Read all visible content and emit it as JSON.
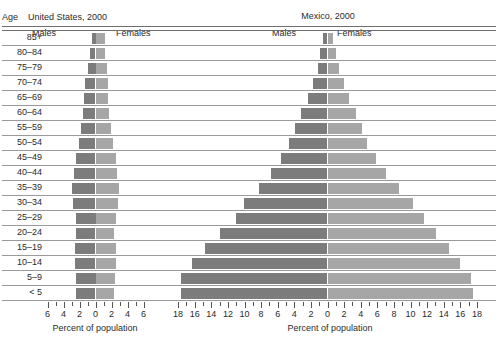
{
  "axis_header": "Age",
  "panels": [
    {
      "key": "united_states",
      "title": "United States, 2000",
      "males_label": "Males",
      "females_label": "Females",
      "xlabel": "Percent of population",
      "tick_labels": [
        "6",
        "4",
        "2",
        "0",
        "2",
        "4",
        "6"
      ]
    },
    {
      "key": "mexico",
      "title": "Mexico, 2000",
      "males_label": "Males",
      "females_label": "Females",
      "xlabel": "Percent of population",
      "tick_labels": [
        "18",
        "16",
        "14",
        "12",
        "10",
        "8",
        "6",
        "4",
        "2",
        "0",
        "2",
        "4",
        "6",
        "8",
        "10",
        "12",
        "14",
        "16",
        "18"
      ]
    }
  ],
  "colors": {
    "male_bar": "#7c7c7c",
    "female_bar": "#a6a6a6",
    "rule": "#9a9a9a",
    "text": "#2b2b2b",
    "background": "#ffffff"
  },
  "chart_data": {
    "type": "bar",
    "subtype": "population-pyramid",
    "xlabel": "Percent of population",
    "ylabel": "Age",
    "grid": true,
    "legend": [
      "Males",
      "Females"
    ],
    "legend_position": "top-inside",
    "categories": [
      "85+",
      "80–84",
      "75–79",
      "70–74",
      "65–69",
      "60–64",
      "55–59",
      "50–54",
      "45–49",
      "40–44",
      "35–39",
      "30–34",
      "25–29",
      "20–24",
      "15–19",
      "10–14",
      "5–9",
      "< 5"
    ],
    "panels": [
      {
        "name": "United States, 2000",
        "xlim": [
          -6,
          6
        ],
        "xticks": [
          -6,
          -4,
          -2,
          0,
          2,
          4,
          6
        ],
        "xtick_labels": [
          "6",
          "4",
          "2",
          "0",
          "2",
          "4",
          "6"
        ],
        "series": [
          {
            "name": "Males",
            "side": "left",
            "values": [
              0.5,
              0.7,
              1.0,
              1.3,
              1.4,
              1.6,
              1.8,
              2.1,
              2.4,
              2.7,
              2.9,
              2.8,
              2.5,
              2.4,
              2.6,
              2.6,
              2.5,
              2.4
            ]
          },
          {
            "name": "Females",
            "side": "right",
            "values": [
              1.2,
              1.2,
              1.4,
              1.6,
              1.6,
              1.7,
              1.9,
              2.2,
              2.5,
              2.7,
              2.9,
              2.8,
              2.5,
              2.3,
              2.5,
              2.5,
              2.4,
              2.3
            ]
          }
        ]
      },
      {
        "name": "Mexico, 2000",
        "xlim": [
          -18,
          18
        ],
        "xticks": [
          -18,
          -16,
          -14,
          -12,
          -10,
          -8,
          -6,
          -4,
          -2,
          0,
          2,
          4,
          6,
          8,
          10,
          12,
          14,
          16,
          18
        ],
        "xtick_labels": [
          "18",
          "16",
          "14",
          "12",
          "10",
          "8",
          "6",
          "4",
          "2",
          "0",
          "2",
          "4",
          "6",
          "8",
          "10",
          "12",
          "14",
          "16",
          "18"
        ],
        "series": [
          {
            "name": "Males",
            "side": "left",
            "values": [
              0.6,
              0.9,
              1.2,
              1.8,
              2.4,
              3.2,
              3.9,
              4.6,
              5.6,
              6.8,
              8.2,
              10.1,
              11.0,
              13.0,
              14.8,
              16.3,
              17.6,
              17.7
            ]
          },
          {
            "name": "Females",
            "side": "right",
            "values": [
              0.7,
              1.0,
              1.4,
              2.0,
              2.6,
              3.4,
              4.1,
              4.8,
              5.8,
              7.0,
              8.6,
              10.3,
              11.6,
              13.1,
              14.6,
              16.0,
              17.3,
              17.5
            ]
          }
        ]
      }
    ]
  }
}
